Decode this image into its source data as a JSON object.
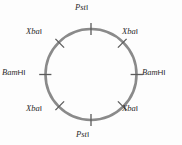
{
  "figure": {
    "kind": "circular-plasmid-restriction-map",
    "background_color": "#fdfdfd",
    "circle": {
      "center_x": 91,
      "center_y": 74.5,
      "radius": 45.5,
      "stroke_color": "#8a8a8a",
      "stroke_width": 2.6,
      "fill": "none"
    },
    "tick": {
      "color": "#5a5a5a",
      "width": 1.3,
      "inner_extent": 6,
      "outer_extent": 6
    }
  },
  "sites": [
    {
      "id": "pst-top",
      "enzyme": "Pst",
      "numeral": "I",
      "full_label": "PstI",
      "angle_deg": 90,
      "position": "top",
      "tick_orientation": "vertical"
    },
    {
      "id": "xba-top-right",
      "enzyme": "Xba",
      "numeral": "I",
      "full_label": "XbaI",
      "angle_deg": 45,
      "position": "top-right",
      "tick_orientation": "diagonal"
    },
    {
      "id": "bam-right",
      "enzyme": "Bam",
      "numeral": "HI",
      "full_label": "BamHI",
      "angle_deg": 0,
      "position": "right",
      "tick_orientation": "horizontal"
    },
    {
      "id": "xba-bottom-right",
      "enzyme": "Xba",
      "numeral": "I",
      "full_label": "XbaI",
      "angle_deg": 315,
      "position": "bottom-right",
      "tick_orientation": "diagonal"
    },
    {
      "id": "pst-bottom",
      "enzyme": "Pst",
      "numeral": "I",
      "full_label": "PstI",
      "angle_deg": 270,
      "position": "bottom",
      "tick_orientation": "vertical"
    },
    {
      "id": "xba-bottom-left",
      "enzyme": "Xba",
      "numeral": "I",
      "full_label": "XbaI",
      "angle_deg": 225,
      "position": "bottom-left",
      "tick_orientation": "diagonal"
    },
    {
      "id": "bam-left",
      "enzyme": "Bam",
      "numeral": "HI",
      "full_label": "BamHI",
      "angle_deg": 180,
      "position": "left",
      "tick_orientation": "horizontal"
    },
    {
      "id": "xba-top-left",
      "enzyme": "Xba",
      "numeral": "I",
      "full_label": "XbaI",
      "angle_deg": 135,
      "position": "top-left",
      "tick_orientation": "diagonal"
    }
  ]
}
